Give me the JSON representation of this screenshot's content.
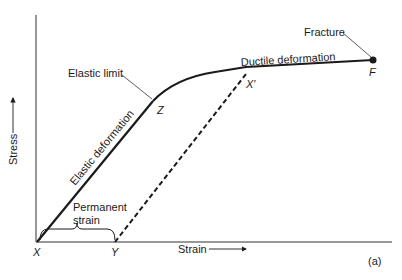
{
  "figure": {
    "panel_label": "(a)",
    "axes": {
      "y_label": "Stress",
      "x_label": "Strain"
    },
    "annotations": {
      "elastic_limit": "Elastic limit",
      "fracture": "Fracture",
      "elastic_deformation": "Elastic deformation",
      "ductile_deformation": "Ductile deformation",
      "permanent_strain_line1": "Permanent",
      "permanent_strain_line2": "strain"
    },
    "points": {
      "x": "X",
      "y": "Y",
      "z": "Z",
      "x_prime": "X′",
      "f": "F"
    },
    "colors": {
      "line": "#1a1a1a",
      "background": "#ffffff"
    }
  }
}
